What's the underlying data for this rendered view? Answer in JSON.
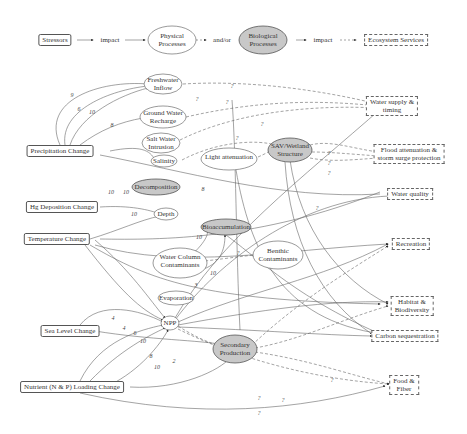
{
  "legend": {
    "stressors": "Stressors",
    "impact1": "impact",
    "physical": "Physical\nProcesses",
    "andor": "and/or",
    "biological": "Biological\nProcesses",
    "impact2": "impact",
    "services": "Ecosystem Services"
  },
  "stressors": [
    {
      "id": "precip",
      "label": "Precipitation Change",
      "x": 60,
      "y": 151
    },
    {
      "id": "hg",
      "label": "Hg Deposition Change",
      "x": 62,
      "y": 207
    },
    {
      "id": "temp",
      "label": "Temperature Change",
      "x": 57,
      "y": 239
    },
    {
      "id": "sea",
      "label": "Sea Level Change",
      "x": 70,
      "y": 331
    },
    {
      "id": "nutrient",
      "label": "Nutrient (N & P) Loading Change",
      "x": 72,
      "y": 387
    }
  ],
  "physical": [
    {
      "id": "freshwater",
      "label": "Freshwater\nInflow",
      "x": 163,
      "y": 84
    },
    {
      "id": "groundwater",
      "label": "Ground Water\nRecharge",
      "x": 163,
      "y": 117
    },
    {
      "id": "saltwater",
      "label": "Salt Water\nIntrusion",
      "x": 161,
      "y": 143
    },
    {
      "id": "salinity",
      "label": "Salinity",
      "x": 164,
      "y": 161
    },
    {
      "id": "light",
      "label": "Light attenuation",
      "x": 229,
      "y": 157
    },
    {
      "id": "depth",
      "label": "Depth",
      "x": 166,
      "y": 214
    },
    {
      "id": "wcc",
      "label": "Water Column\nContaminants",
      "x": 180,
      "y": 261
    },
    {
      "id": "benthic",
      "label": "Benthic\nContaminants",
      "x": 278,
      "y": 255
    },
    {
      "id": "evap",
      "label": "Evaporation",
      "x": 176,
      "y": 297
    }
  ],
  "biological": [
    {
      "id": "sav",
      "label": "SAV/Wetland\nStructure",
      "x": 290,
      "y": 150
    },
    {
      "id": "decomp",
      "label": "Decomposition",
      "x": 156,
      "y": 187
    },
    {
      "id": "bioacc",
      "label": "Bioaccumulation",
      "x": 226,
      "y": 227
    },
    {
      "id": "npp",
      "label": "NPP",
      "x": 170,
      "y": 323
    },
    {
      "id": "secondary",
      "label": "Secondary\nProduction",
      "x": 235,
      "y": 349
    }
  ],
  "services": [
    {
      "id": "water",
      "label": "Water supply &\ntiming",
      "x": 392,
      "y": 106
    },
    {
      "id": "flood",
      "label": "Flood attenuation &\nstorm surge protection",
      "x": 409,
      "y": 154
    },
    {
      "id": "quality",
      "label": "Water quality",
      "x": 410,
      "y": 194
    },
    {
      "id": "recreation",
      "label": "Recreation",
      "x": 411,
      "y": 244
    },
    {
      "id": "habitat",
      "label": "Habitat &\nBiodiversity",
      "x": 412,
      "y": 306
    },
    {
      "id": "carbon",
      "label": "Carbon sequestration",
      "x": 405,
      "y": 336
    },
    {
      "id": "food",
      "label": "Food &\nFiber",
      "x": 404,
      "y": 385
    }
  ],
  "edge_labels": [
    {
      "t": "9",
      "x": 72,
      "y": 95
    },
    {
      "t": "6",
      "x": 79,
      "y": 109
    },
    {
      "t": "10",
      "x": 92,
      "y": 112
    },
    {
      "t": "8",
      "x": 112,
      "y": 125
    },
    {
      "t": "?",
      "x": 232,
      "y": 86
    },
    {
      "t": "?",
      "x": 197,
      "y": 99
    },
    {
      "t": "?",
      "x": 227,
      "y": 102
    },
    {
      "t": "?",
      "x": 262,
      "y": 124
    },
    {
      "t": "?",
      "x": 237,
      "y": 138
    },
    {
      "t": "10",
      "x": 111,
      "y": 192
    },
    {
      "t": "10",
      "x": 126,
      "y": 192
    },
    {
      "t": "10",
      "x": 134,
      "y": 214
    },
    {
      "t": "8",
      "x": 203,
      "y": 189
    },
    {
      "t": "10",
      "x": 199,
      "y": 237
    },
    {
      "t": "10",
      "x": 213,
      "y": 273
    },
    {
      "t": "3",
      "x": 196,
      "y": 285
    },
    {
      "t": "?",
      "x": 238,
      "y": 253
    },
    {
      "t": "?",
      "x": 317,
      "y": 208
    },
    {
      "t": "4",
      "x": 113,
      "y": 318
    },
    {
      "t": "4",
      "x": 124,
      "y": 328
    },
    {
      "t": "6",
      "x": 135,
      "y": 333
    },
    {
      "t": "10",
      "x": 143,
      "y": 341
    },
    {
      "t": "8",
      "x": 151,
      "y": 356
    },
    {
      "t": "10",
      "x": 157,
      "y": 367
    },
    {
      "t": "2",
      "x": 174,
      "y": 361
    },
    {
      "t": "?",
      "x": 332,
      "y": 380
    },
    {
      "t": "?",
      "x": 259,
      "y": 398
    },
    {
      "t": "?",
      "x": 283,
      "y": 400
    },
    {
      "t": "?",
      "x": 259,
      "y": 413
    },
    {
      "t": "?",
      "x": 329,
      "y": 153
    },
    {
      "t": "?",
      "x": 329,
      "y": 163
    },
    {
      "t": "?",
      "x": 329,
      "y": 173
    }
  ],
  "colors": {
    "bio_fill": "#c8c8c8",
    "line": "#555555",
    "dash": "#666666"
  }
}
